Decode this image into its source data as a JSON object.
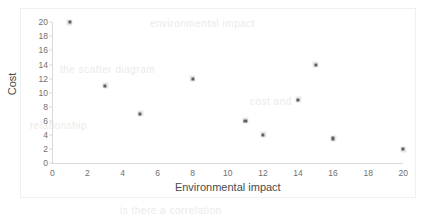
{
  "figure": {
    "background_color": "#ffffff",
    "axis_color": "#d9d9d9",
    "marker_color": "#5a5a5a"
  },
  "bleed_text": [
    {
      "text": "environmental impact",
      "x": 150,
      "y": 18
    },
    {
      "text": "the scatter diagram",
      "x": 60,
      "y": 64
    },
    {
      "text": "cost and",
      "x": 250,
      "y": 96
    },
    {
      "text": "relationship",
      "x": 30,
      "y": 120
    },
    {
      "text": "is there a correlation",
      "x": 120,
      "y": 205
    }
  ],
  "chart_data": {
    "type": "scatter",
    "title": "",
    "xlabel": "Environmental impact",
    "ylabel": "Cost",
    "xlim": [
      0,
      20
    ],
    "ylim": [
      0,
      20
    ],
    "xticks": [
      0,
      2,
      4,
      6,
      8,
      10,
      12,
      14,
      16,
      18,
      20
    ],
    "yticks": [
      0,
      2,
      4,
      6,
      8,
      10,
      12,
      14,
      16,
      18,
      20
    ],
    "xtick_labels": [
      "0",
      "2",
      "4",
      "6",
      "8",
      "10",
      "12",
      "14",
      "16",
      "18",
      "20"
    ],
    "ytick_labels": [
      "0",
      "2",
      "4",
      "6",
      "8",
      "10",
      "12",
      "14",
      "16",
      "18",
      "20"
    ],
    "grid": false,
    "legend": false,
    "series": [
      {
        "name": "Cost vs Environmental impact",
        "points": [
          {
            "x": 1,
            "y": 20
          },
          {
            "x": 3,
            "y": 11
          },
          {
            "x": 5,
            "y": 7
          },
          {
            "x": 8,
            "y": 12
          },
          {
            "x": 11,
            "y": 6
          },
          {
            "x": 12,
            "y": 4
          },
          {
            "x": 14,
            "y": 9
          },
          {
            "x": 15,
            "y": 14
          },
          {
            "x": 16,
            "y": 3.5
          },
          {
            "x": 20,
            "y": 2
          }
        ]
      }
    ]
  }
}
